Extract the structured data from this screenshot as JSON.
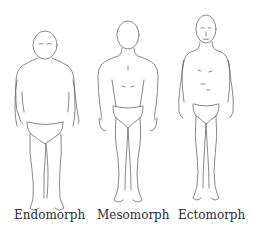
{
  "figures": [
    {
      "label": "Endomorph",
      "body_type": "endomorph"
    },
    {
      "label": "Mesomorph",
      "body_type": "mesomorph"
    },
    {
      "label": "Ectomorph",
      "body_type": "ectomorph"
    }
  ],
  "colors": {
    "background": "#ffffff",
    "line": "#555555",
    "text": "#2a2a2a"
  }
}
